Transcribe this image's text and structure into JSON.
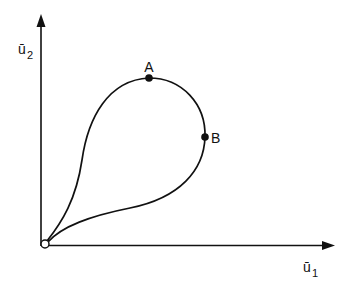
{
  "diagram": {
    "axes": {
      "x_label": "ū",
      "x_label_sub": "1",
      "y_label": "ū",
      "y_label_sub": "2"
    },
    "points": [
      {
        "id": "origin",
        "label": "",
        "marker": "open-circle"
      },
      {
        "id": "A",
        "label": "A",
        "marker": "filled-dot"
      },
      {
        "id": "B",
        "label": "B",
        "marker": "filled-dot"
      }
    ],
    "curve": "closed teardrop loop starting and ending at origin, passing through A (top) and B (rightmost)",
    "colors": {
      "stroke": "#111111",
      "background": "#ffffff"
    }
  }
}
